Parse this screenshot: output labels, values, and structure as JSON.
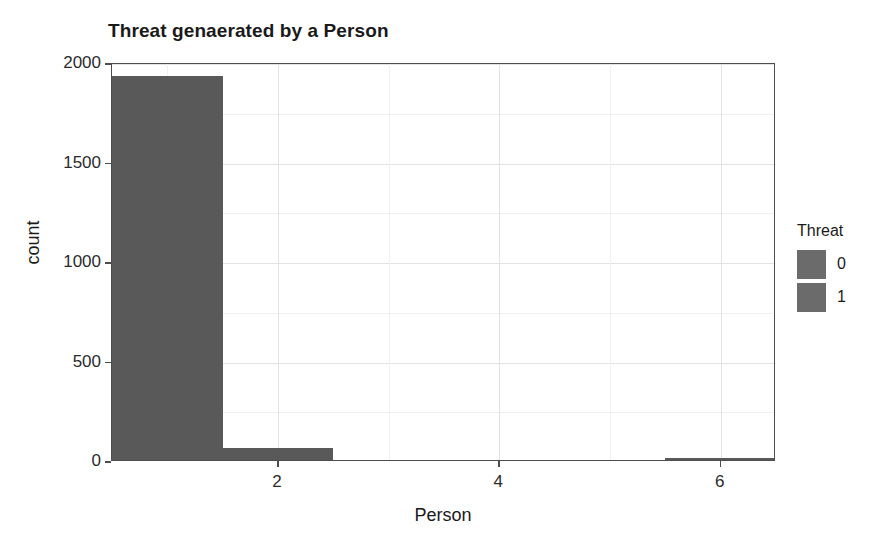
{
  "chart_data": {
    "type": "bar",
    "title": "Threat genaerated by a Person",
    "xlabel": "Person",
    "ylabel": "count",
    "x": [
      1,
      2,
      3,
      4,
      5,
      6
    ],
    "values": [
      1930,
      60,
      0,
      0,
      0,
      8
    ],
    "categories": [
      "1",
      "2",
      "3",
      "4",
      "5",
      "6"
    ],
    "series": [
      {
        "name": "0",
        "values": [
          1930,
          60,
          0,
          0,
          0,
          8
        ]
      },
      {
        "name": "1",
        "values": [
          0,
          0,
          0,
          0,
          0,
          0
        ]
      }
    ],
    "xlim": [
      0.5,
      6.5
    ],
    "ylim": [
      0,
      2000
    ],
    "x_ticks": [
      "2",
      "4",
      "6"
    ],
    "x_tick_values": [
      2,
      4,
      6
    ],
    "y_ticks": [
      "0",
      "500",
      "1000",
      "1500",
      "2000"
    ],
    "y_tick_values": [
      0,
      500,
      1000,
      1500,
      2000
    ],
    "y_minor_gridlines": [
      250,
      750,
      1250,
      1750
    ],
    "x_minor_gridlines": [
      1,
      3,
      5
    ],
    "grid": true,
    "legend": {
      "title": "Threat",
      "position": "right",
      "entries": [
        {
          "label": "0",
          "color": "#6b6b6b"
        },
        {
          "label": "1",
          "color": "#6b6b6b"
        }
      ]
    },
    "bar_color": "#595959",
    "bar_width": 1,
    "panel_border_color": "#4d4d4d",
    "grid_major_color": "#e2e2e2",
    "grid_minor_color": "#f1f1f1",
    "background": "#ffffff"
  }
}
